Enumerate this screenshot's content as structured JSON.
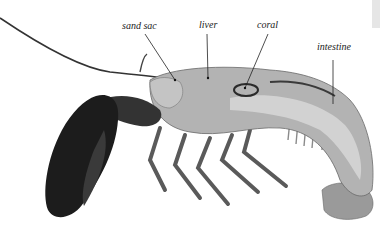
{
  "figure": {
    "labels": [
      {
        "id": "sand_sac",
        "text": "sand sac",
        "x": 122,
        "y": 20
      },
      {
        "id": "liver",
        "text": "liver",
        "x": 199,
        "y": 19
      },
      {
        "id": "coral",
        "text": "coral",
        "x": 257,
        "y": 19
      },
      {
        "id": "intestine",
        "text": "intestine",
        "x": 317,
        "y": 41
      }
    ],
    "colors": {
      "background": "#ffffff",
      "claw": "#1c1c1c",
      "body": "#a9a9a9",
      "label": "#222222"
    }
  }
}
